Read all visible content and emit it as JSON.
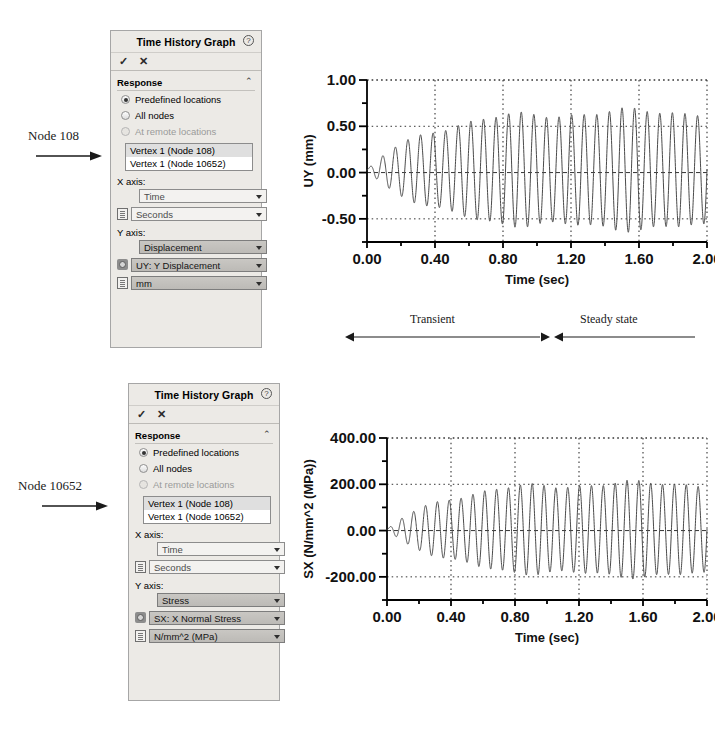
{
  "annotations": {
    "node_top": "Node 108",
    "node_bottom": "Node 10652",
    "phase_transient": "Transient",
    "phase_steady": "Steady state"
  },
  "panel_top": {
    "title": "Time History Graph",
    "help_glyph": "?",
    "ok_glyph": "✓",
    "cancel_glyph": "✕",
    "section": {
      "title": "Response",
      "collapse_glyph": "⌃"
    },
    "radios": [
      {
        "label": "Predefined locations",
        "checked": true,
        "disabled": false
      },
      {
        "label": "All nodes",
        "checked": false,
        "disabled": false
      },
      {
        "label": "At remote locations",
        "checked": false,
        "disabled": true
      }
    ],
    "list": [
      {
        "label": "Vertex 1 (Node 108)",
        "selected": true
      },
      {
        "label": "Vertex 1 (Node 10652)",
        "selected": false
      }
    ],
    "x_axis_label": "X axis:",
    "x_quantity": "Time",
    "x_unit": "Seconds",
    "y_axis_label": "Y axis:",
    "y_quantity": "Displacement",
    "y_component": "UY: Y Displacement",
    "y_unit": "mm"
  },
  "panel_bottom": {
    "title": "Time History Graph",
    "help_glyph": "?",
    "ok_glyph": "✓",
    "cancel_glyph": "✕",
    "section": {
      "title": "Response",
      "collapse_glyph": "⌃"
    },
    "radios": [
      {
        "label": "Predefined locations",
        "checked": true,
        "disabled": false
      },
      {
        "label": "All nodes",
        "checked": false,
        "disabled": false
      },
      {
        "label": "At remote locations",
        "checked": false,
        "disabled": true
      }
    ],
    "list": [
      {
        "label": "Vertex 1 (Node 108)",
        "selected": true
      },
      {
        "label": "Vertex 1 (Node 10652)",
        "selected": false
      }
    ],
    "x_axis_label": "X axis:",
    "x_quantity": "Time",
    "x_unit": "Seconds",
    "y_axis_label": "Y axis:",
    "y_quantity": "Stress",
    "y_component": "SX: X Normal Stress",
    "y_unit": "N/mm^2 (MPa)"
  },
  "chart_data": [
    {
      "id": "uy-chart",
      "type": "line",
      "title": "",
      "xlabel": "Time (sec)",
      "ylabel": "UY (mm)",
      "xlim": [
        0.0,
        2.0
      ],
      "ylim": [
        -0.75,
        1.0
      ],
      "xticks": [
        0.0,
        0.2,
        0.4,
        0.6,
        0.8,
        1.0,
        1.2,
        1.4,
        1.6,
        1.8,
        2.0
      ],
      "xticklabels": [
        "0.00",
        "",
        "0.40",
        "",
        "0.80",
        "",
        "1.20",
        "",
        "1.60",
        "",
        "2.00"
      ],
      "yticks": [
        -0.75,
        -0.5,
        -0.25,
        0.0,
        0.25,
        0.5,
        0.75,
        1.0
      ],
      "yticklabels": [
        "",
        "-0.50",
        "",
        "0.00",
        "",
        "0.50",
        "",
        "1.00"
      ],
      "grid": true,
      "grid_style": "dotted",
      "line_color": "#4a4a4a",
      "series": [
        {
          "name": "UY (mm)",
          "waveform": "damped-growing-sine",
          "frequency_hz": 13.5,
          "steady_amplitude": 0.63,
          "steady_offset": 0.03,
          "growth_time_constant": 0.35,
          "beat_frequency_hz": 1.4,
          "start_value": 0.0
        }
      ],
      "phase_markers": [
        {
          "label": "Transient",
          "from": 0.0,
          "to": 1.28
        },
        {
          "label": "Steady state",
          "from": 1.28,
          "to": 2.0
        }
      ]
    },
    {
      "id": "sx-chart",
      "type": "line",
      "title": "",
      "xlabel": "Time (sec)",
      "ylabel": "SX (N/mm^2 (MPa))",
      "xlim": [
        0.0,
        2.0
      ],
      "ylim": [
        -300.0,
        400.0
      ],
      "xticks": [
        0.0,
        0.2,
        0.4,
        0.6,
        0.8,
        1.0,
        1.2,
        1.4,
        1.6,
        1.8,
        2.0
      ],
      "xticklabels": [
        "0.00",
        "",
        "0.40",
        "",
        "0.80",
        "",
        "1.20",
        "",
        "1.60",
        "",
        "2.00"
      ],
      "yticks": [
        -300,
        -200,
        -100,
        0,
        100,
        200,
        300,
        400
      ],
      "yticklabels": [
        "",
        "-200.00",
        "",
        "0.00",
        "",
        "200.00",
        "",
        "400.00"
      ],
      "grid": true,
      "grid_style": "dotted",
      "line_color": "#4a4a4a",
      "series": [
        {
          "name": "SX (N/mm^2 (MPa))",
          "waveform": "damped-growing-sine",
          "frequency_hz": 13.5,
          "steady_amplitude": 200.0,
          "steady_offset": 5.0,
          "growth_time_constant": 0.35,
          "beat_frequency_hz": 1.4,
          "start_value": 0.0
        }
      ],
      "phase_markers": []
    }
  ]
}
